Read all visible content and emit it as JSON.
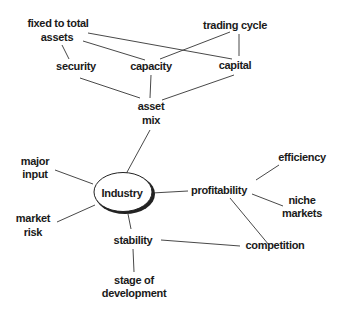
{
  "diagram": {
    "type": "mind-map",
    "center": {
      "id": "industry",
      "label": "Industry"
    },
    "nodes": [
      {
        "id": "fixed",
        "lines": [
          "fixed to total",
          "assets"
        ]
      },
      {
        "id": "trading",
        "lines": [
          "trading cycle"
        ]
      },
      {
        "id": "security",
        "lines": [
          "security"
        ]
      },
      {
        "id": "capacity",
        "lines": [
          "capacity"
        ]
      },
      {
        "id": "capital",
        "lines": [
          "capital"
        ]
      },
      {
        "id": "assetmix",
        "lines": [
          "asset",
          "mix"
        ]
      },
      {
        "id": "major",
        "lines": [
          "major",
          "input"
        ]
      },
      {
        "id": "market",
        "lines": [
          "market",
          "risk"
        ]
      },
      {
        "id": "profitability",
        "lines": [
          "profitability"
        ]
      },
      {
        "id": "efficiency",
        "lines": [
          "efficiency"
        ]
      },
      {
        "id": "niche",
        "lines": [
          "niche",
          "markets"
        ]
      },
      {
        "id": "stability",
        "lines": [
          "stability"
        ]
      },
      {
        "id": "competition",
        "lines": [
          "competition"
        ]
      },
      {
        "id": "stage",
        "lines": [
          "stage of",
          "development"
        ]
      }
    ],
    "edges": [
      [
        "fixed",
        "security"
      ],
      [
        "fixed",
        "capacity"
      ],
      [
        "fixed",
        "capital"
      ],
      [
        "trading",
        "capacity"
      ],
      [
        "trading",
        "capital"
      ],
      [
        "security",
        "assetmix"
      ],
      [
        "capacity",
        "assetmix"
      ],
      [
        "capital",
        "assetmix"
      ],
      [
        "assetmix",
        "industry"
      ],
      [
        "major",
        "industry"
      ],
      [
        "market",
        "industry"
      ],
      [
        "industry",
        "profitability"
      ],
      [
        "industry",
        "stability"
      ],
      [
        "profitability",
        "efficiency"
      ],
      [
        "profitability",
        "niche"
      ],
      [
        "profitability",
        "competition"
      ],
      [
        "stability",
        "competition"
      ],
      [
        "stability",
        "stage"
      ]
    ]
  }
}
